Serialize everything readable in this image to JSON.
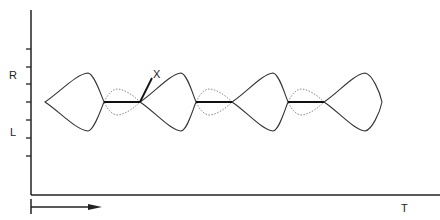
{
  "diagram": {
    "y_axis_labels": {
      "upper": "R",
      "lower": "L"
    },
    "x_axis_label": "T",
    "pointer_label": "X",
    "colors": {
      "ink": "#222222",
      "dotted": "#888888"
    },
    "y_ticks": [
      49,
      67,
      84,
      102,
      120,
      138,
      156
    ],
    "center_y": 102,
    "lobes": [
      {
        "start": 45,
        "peak": 88,
        "end": 104,
        "amp": 29
      },
      {
        "start": 140,
        "peak": 181,
        "end": 196,
        "amp": 29
      },
      {
        "start": 232,
        "peak": 273,
        "end": 288,
        "amp": 29
      },
      {
        "start": 324,
        "peak": 365,
        "end": 382,
        "amp": 29
      }
    ],
    "bold_segments": [
      [
        104,
        140
      ],
      [
        196,
        232
      ],
      [
        288,
        324
      ]
    ],
    "direction_arrow": {
      "from_x": 31,
      "to_x": 100,
      "y": 207
    }
  }
}
